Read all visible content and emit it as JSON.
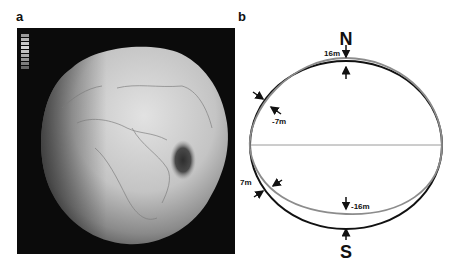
{
  "figure": {
    "panels": [
      {
        "label": "a",
        "description": "Shaded relief rendering of the geoid (potato-shaped Earth) centered on Africa/Eurasia, with a dark low over the Indian Ocean",
        "legend_swatches": 9,
        "colors": {
          "background": "#0b0b0b",
          "globe_light": "#d9d9d9",
          "globe_dark": "#6a6a6a",
          "low_anomaly": "#3a3a3a"
        }
      },
      {
        "label": "b",
        "description": "Pear-shaped Earth schematic: reference ellipse vs. exaggerated geoid outline",
        "pole_north": "N",
        "pole_south": "S",
        "annotations": [
          {
            "text": "16m",
            "position": "north pole"
          },
          {
            "text": "-7m",
            "position": "north mid-latitude (left)"
          },
          {
            "text": "7m",
            "position": "south mid-latitude (left)"
          },
          {
            "text": "-16m",
            "position": "south pole"
          }
        ],
        "colors": {
          "reference_outline": "#111111",
          "geoid_outline": "#8c8c8c",
          "equator": "#9a9a9a"
        }
      }
    ]
  }
}
